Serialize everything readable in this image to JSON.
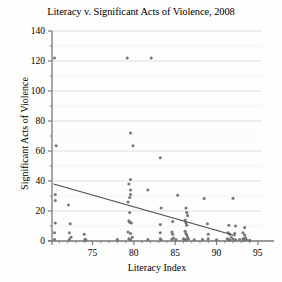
{
  "chart_data": {
    "type": "scatter",
    "title": "Literacy v. Significant Acts of Violence, 2008",
    "xlabel": "Literacy Index",
    "ylabel": "Significant Acts of Violence",
    "xlim": [
      70.1,
      95.5
    ],
    "ylim": [
      0,
      140
    ],
    "xticks": [
      75,
      80,
      85,
      90,
      95
    ],
    "yticks": [
      0,
      20,
      40,
      60,
      80,
      100,
      120,
      140
    ],
    "grid": true,
    "grid_axis": "y",
    "legend": "none",
    "marker_color": "#6d6d6d",
    "trendline_color": "#4a4a4a",
    "axis_color": "#7a7a7a",
    "grid_color": "#d8d8d8",
    "trendline": {
      "x_start": 70.3,
      "y_start": 38,
      "x_end": 92.3,
      "y_end": 3.5
    },
    "points": [
      [
        70.4,
        122
      ],
      [
        79.2,
        122
      ],
      [
        82.1,
        122
      ],
      [
        70.6,
        63.5
      ],
      [
        79.9,
        63.5
      ],
      [
        83.2,
        55.5
      ],
      [
        79.6,
        72
      ],
      [
        79.6,
        41
      ],
      [
        70.5,
        31
      ],
      [
        70.5,
        27
      ],
      [
        72.1,
        24
      ],
      [
        79.4,
        38
      ],
      [
        79.6,
        34
      ],
      [
        81.7,
        34
      ],
      [
        85.3,
        30.5
      ],
      [
        88.5,
        28.3
      ],
      [
        79.3,
        26
      ],
      [
        83.3,
        22
      ],
      [
        86.3,
        22
      ],
      [
        79.5,
        19
      ],
      [
        92.0,
        28.5
      ],
      [
        70.5,
        12
      ],
      [
        72.3,
        11.5
      ],
      [
        79.4,
        13.5
      ],
      [
        79.5,
        12.5
      ],
      [
        79.7,
        12
      ],
      [
        83.2,
        11
      ],
      [
        84.7,
        13
      ],
      [
        86.2,
        14
      ],
      [
        86.3,
        12
      ],
      [
        86.4,
        10.5
      ],
      [
        88.9,
        11.5
      ],
      [
        91.5,
        10.5
      ],
      [
        92.3,
        10
      ],
      [
        93.4,
        9
      ],
      [
        70.4,
        5.5
      ],
      [
        72.2,
        5.5
      ],
      [
        74.0,
        4.5
      ],
      [
        79.3,
        6
      ],
      [
        79.6,
        5
      ],
      [
        83.2,
        5.5
      ],
      [
        84.6,
        6
      ],
      [
        84.7,
        4.5
      ],
      [
        86.2,
        6.5
      ],
      [
        86.3,
        5
      ],
      [
        86.4,
        4
      ],
      [
        89.0,
        4.5
      ],
      [
        91.4,
        5.5
      ],
      [
        91.6,
        4.5
      ],
      [
        92.2,
        5
      ],
      [
        93.2,
        5.5
      ],
      [
        93.4,
        4
      ],
      [
        70.4,
        1
      ],
      [
        72.2,
        1
      ],
      [
        74.1,
        1.2
      ],
      [
        74.2,
        0.6
      ],
      [
        78.0,
        1
      ],
      [
        79.4,
        1.5
      ],
      [
        79.6,
        0.8
      ],
      [
        81.7,
        1
      ],
      [
        83.2,
        1.5
      ],
      [
        83.3,
        0.7
      ],
      [
        84.6,
        1.2
      ],
      [
        85.1,
        1
      ],
      [
        86.0,
        1.5
      ],
      [
        86.2,
        1
      ],
      [
        86.3,
        0.6
      ],
      [
        86.6,
        1.2
      ],
      [
        87.3,
        0.8
      ],
      [
        88.3,
        1
      ],
      [
        89.0,
        1.4
      ],
      [
        90.0,
        0.8
      ],
      [
        91.3,
        1.5
      ],
      [
        91.5,
        1
      ],
      [
        91.6,
        0.5
      ],
      [
        92.0,
        1.2
      ],
      [
        92.3,
        0.8
      ],
      [
        92.8,
        1
      ],
      [
        93.2,
        1.4
      ],
      [
        93.3,
        0.7
      ],
      [
        93.6,
        1
      ],
      [
        94.0,
        0.5
      ],
      [
        86.4,
        19
      ],
      [
        86.5,
        17
      ],
      [
        79.5,
        29
      ],
      [
        79.6,
        31
      ],
      [
        91.8,
        2.5
      ],
      [
        93.5,
        2.2
      ],
      [
        86.5,
        2.5
      ],
      [
        84.8,
        2
      ],
      [
        79.8,
        2.5
      ],
      [
        72.4,
        2.5
      ]
    ]
  }
}
